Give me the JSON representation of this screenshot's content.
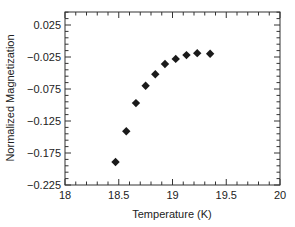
{
  "chart_data": {
    "type": "scatter",
    "title": "",
    "xlabel": "Temperature (K)",
    "ylabel": "Normalized Magnetization",
    "xlim": [
      18,
      20
    ],
    "ylim": [
      -0.225,
      0.045
    ],
    "x_ticks": [
      18,
      18.5,
      19,
      19.5,
      20
    ],
    "x_tick_labels": [
      "18",
      "18.5",
      "19",
      "19.5",
      "20"
    ],
    "x_minor_step": 0.1,
    "y_ticks": [
      -0.225,
      -0.175,
      -0.125,
      -0.075,
      -0.025,
      0.025
    ],
    "y_tick_labels": [
      "-0.225",
      "-0.175",
      "-0.125",
      "-0.075",
      "-0.025",
      "0.025"
    ],
    "y_minor_step": 0.01,
    "grid": false,
    "legend": null,
    "marker": "diamond",
    "marker_color": "#1a1a1a",
    "series": [
      {
        "name": "Normalized Magnetization",
        "x": [
          18.47,
          18.57,
          18.66,
          18.75,
          18.84,
          18.93,
          19.03,
          19.13,
          19.23,
          19.35
        ],
        "y": [
          -0.189,
          -0.141,
          -0.097,
          -0.07,
          -0.052,
          -0.036,
          -0.028,
          -0.022,
          -0.019,
          -0.02
        ]
      }
    ]
  }
}
